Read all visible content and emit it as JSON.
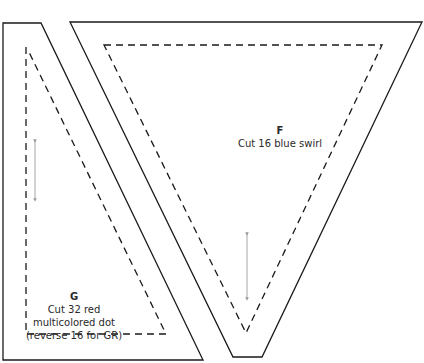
{
  "pieces": [
    {
      "id": "F",
      "letter": "F",
      "instruction": "Cut 16 blue swirl",
      "outline": "70,22 422,22 262,357 233,357",
      "seam": "104,45 382,45 246,333",
      "grain_arrow": {
        "x": 247,
        "y1": 234,
        "y2": 299
      }
    },
    {
      "id": "G",
      "letter": "G",
      "instruction_lines": [
        "Cut 32 red",
        "multicolored dot",
        "(reverse 16 for GR)"
      ],
      "outline": "3,23 41,23 203,360 3,360",
      "seam": "26,47 26,334 166,334 28,50",
      "grain_arrow": {
        "x": 35,
        "y1": 141,
        "y2": 200
      }
    }
  ],
  "colors": {
    "line": "#1a1a1a",
    "arrow": "#9a9a9a",
    "text": "#2a2a2a"
  }
}
